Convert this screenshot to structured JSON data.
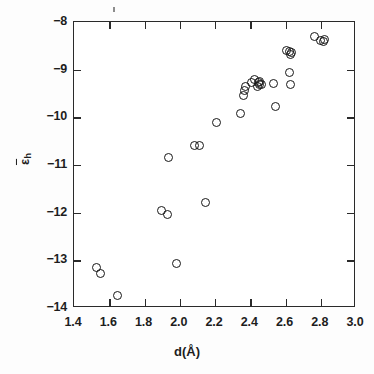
{
  "chart_data": {
    "type": "scatter",
    "title": "",
    "xlabel": "d(Å)",
    "ylabel": "ε̄h",
    "ylabel_parts": {
      "symbol": "ε",
      "overbar": true,
      "subscript": "h"
    },
    "xlim": [
      1.4,
      3.0
    ],
    "ylim": [
      -14,
      -8
    ],
    "xticks": [
      1.4,
      1.6,
      1.8,
      2.0,
      2.2,
      2.4,
      2.6,
      2.8,
      3.0
    ],
    "xticklabels": [
      "1.4",
      "1.6",
      "1.8",
      "2.0",
      "2.2",
      "2.4",
      "2.6",
      "2.8",
      "3.0"
    ],
    "yticks": [
      -14,
      -13,
      -12,
      -11,
      -10,
      -9,
      -8
    ],
    "yticklabels": [
      "-14",
      "-13",
      "-12",
      "-11",
      "-10",
      "-9",
      "-8"
    ],
    "grid": false,
    "legend": null,
    "marker": "open-circle",
    "marker_color": "#171717",
    "frame": "box",
    "n_points": 34,
    "points": [
      {
        "x": 1.532,
        "y": -13.18
      },
      {
        "x": 1.558,
        "y": -13.3
      },
      {
        "x": 1.652,
        "y": -13.76
      },
      {
        "x": 1.9,
        "y": -11.97
      },
      {
        "x": 1.936,
        "y": -12.06
      },
      {
        "x": 1.986,
        "y": -13.08
      },
      {
        "x": 1.944,
        "y": -10.86
      },
      {
        "x": 2.092,
        "y": -10.62
      },
      {
        "x": 2.116,
        "y": -10.62
      },
      {
        "x": 2.154,
        "y": -11.8
      },
      {
        "x": 2.214,
        "y": -10.12
      },
      {
        "x": 2.352,
        "y": -9.94
      },
      {
        "x": 2.368,
        "y": -9.56
      },
      {
        "x": 2.372,
        "y": -9.46
      },
      {
        "x": 2.376,
        "y": -9.38
      },
      {
        "x": 2.414,
        "y": -9.3
      },
      {
        "x": 2.428,
        "y": -9.23
      },
      {
        "x": 2.444,
        "y": -9.38
      },
      {
        "x": 2.452,
        "y": -9.3
      },
      {
        "x": 2.456,
        "y": -9.34
      },
      {
        "x": 2.46,
        "y": -9.26
      },
      {
        "x": 2.468,
        "y": -9.33
      },
      {
        "x": 2.54,
        "y": -9.32
      },
      {
        "x": 2.548,
        "y": -9.79
      },
      {
        "x": 2.626,
        "y": -9.08
      },
      {
        "x": 2.636,
        "y": -9.33
      },
      {
        "x": 2.612,
        "y": -8.62
      },
      {
        "x": 2.63,
        "y": -8.64
      },
      {
        "x": 2.634,
        "y": -8.7
      },
      {
        "x": 2.64,
        "y": -8.66
      },
      {
        "x": 2.77,
        "y": -8.33
      },
      {
        "x": 2.806,
        "y": -8.4
      },
      {
        "x": 2.82,
        "y": -8.42
      },
      {
        "x": 2.826,
        "y": -8.38
      }
    ]
  },
  "figure": {
    "background_color": "#ffffff",
    "axis_color": "#2a2a2a"
  }
}
